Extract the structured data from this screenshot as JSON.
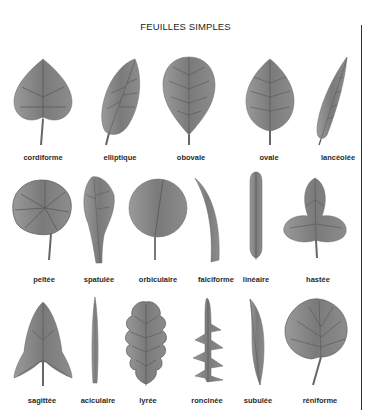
{
  "title": "FEUILLES SIMPLES",
  "rows": [
    {
      "leaves": [
        {
          "name": "cordiforme"
        },
        {
          "name": "elliptique"
        },
        {
          "name": "obovale"
        },
        {
          "name": "ovale"
        },
        {
          "name": "lancéolée"
        }
      ]
    },
    {
      "leaves": [
        {
          "name": "peltée"
        },
        {
          "name": "spatulée"
        },
        {
          "name": "orbiculaire"
        },
        {
          "name": "falciforme"
        },
        {
          "name": "linéaire"
        },
        {
          "name": "hastée"
        }
      ]
    },
    {
      "leaves": [
        {
          "name": "sagittée"
        },
        {
          "name": "aciculaire"
        },
        {
          "name": "lyrée"
        },
        {
          "name": "roncinée"
        },
        {
          "name": "subulée"
        },
        {
          "name": "réniforme"
        }
      ]
    }
  ],
  "colors": {
    "background": "#ffffff",
    "leaf_fill": "#8a8a8a",
    "leaf_dark": "#5a5a5a",
    "text": "#2a2a2a",
    "rule": "#333333"
  }
}
